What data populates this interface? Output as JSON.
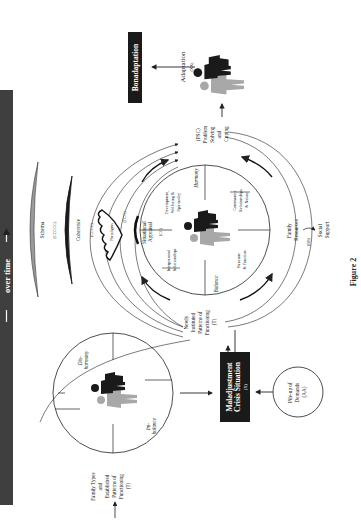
{
  "banner": {
    "label": "over time",
    "bg": "#3f3f3f",
    "fg": "#ffffff"
  },
  "initial": {
    "input_label_lines": [
      "Family Types",
      "and",
      "Established",
      "Patterns of",
      "Functioning",
      "(T)"
    ],
    "quadrants": {
      "top_right": [
        "Dis-",
        "harmony"
      ],
      "bottom_left": [
        "Im-",
        "balance"
      ]
    }
  },
  "crisis": {
    "lines": [
      "Maladjustment",
      "Crisis Situation"
    ],
    "code": "(X)"
  },
  "pileup": {
    "lines": [
      "Pile-up of",
      "Demands",
      "(AA)"
    ]
  },
  "newly": {
    "lines": [
      "Newly",
      "Instituted",
      "Patterns of",
      "Functioning",
      "(T)"
    ]
  },
  "appraisal": {
    "schema": {
      "label": "Schema",
      "code": "(CCCCC)"
    },
    "coherence": {
      "label": "Coherence",
      "code": "(CCCC)"
    },
    "paradigms": {
      "label": "Paradigms",
      "code": "(CCC)"
    },
    "situational": {
      "lines": [
        "Situational",
        "Appraisal"
      ],
      "code": "(CC)"
    }
  },
  "resilience_circle": {
    "quadrants": {
      "top_left": [
        "Interpersonal",
        "Relationships"
      ],
      "top_right": [
        "Development,",
        "Wellbeing &",
        "Spirituality"
      ],
      "bottom_left": [
        "Structure",
        "& Function"
      ],
      "bottom_right": [
        "Community",
        "Relationships",
        "& Nature"
      ]
    },
    "axis_labels": {
      "left": "Balance",
      "right": "Harmony"
    }
  },
  "resources": {
    "family": [
      "Family",
      "Resources"
    ],
    "code": "(BB)",
    "social": [
      "Social",
      "Support"
    ]
  },
  "psc": {
    "lines": [
      "(PSC)",
      "Problem",
      "Solving",
      "and",
      "Coping"
    ]
  },
  "adaptation": {
    "label": "Adaptation",
    "code": "(XX)"
  },
  "bonadaptation": {
    "label": "Bonadaptation"
  },
  "caption": {
    "label": "Figure 2"
  },
  "colors": {
    "dark": "#1a1a1a",
    "gray_figure": "#a8a8a8",
    "schema_fill": "#9a9a9a",
    "box_bg": "#1a1a1a"
  }
}
